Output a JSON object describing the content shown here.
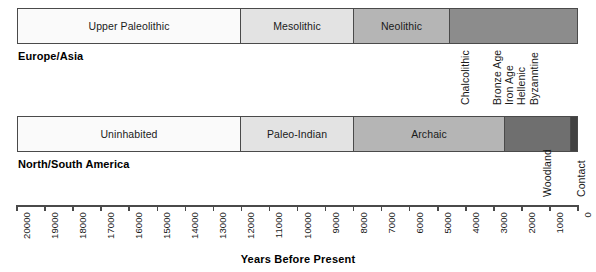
{
  "chart_data": {
    "type": "bar",
    "title": "",
    "xlabel": "Years Before Present",
    "ylabel": "",
    "xlim": [
      20000,
      0
    ],
    "x_tick_step": 1000,
    "x_direction": "reversed",
    "grid": false,
    "legend": false,
    "axis_ticks": [
      "20000",
      "19000",
      "18000",
      "17000",
      "16000",
      "15000",
      "14000",
      "13000",
      "12000",
      "11000",
      "10000",
      "9000",
      "8000",
      "7000",
      "6000",
      "5000",
      "4000",
      "3000",
      "2000",
      "1000",
      "0"
    ],
    "series": [
      {
        "name": "Europe/Asia",
        "segments": [
          {
            "label": "Upper Paleolithic",
            "start": 20000,
            "end": 12000,
            "color": "#fafafa",
            "label_placement": "inside"
          },
          {
            "label": "Mesolithic",
            "start": 12000,
            "end": 8000,
            "color": "#e3e3e3",
            "label_placement": "inside"
          },
          {
            "label": "Neolithic",
            "start": 8000,
            "end": 4600,
            "color": "#b5b5b5",
            "label_placement": "inside"
          },
          {
            "label": "Chalcolithic",
            "start": 4600,
            "end": 0,
            "color": "#8c8c8c",
            "label_placement": "below-vertical"
          },
          {
            "label": "Bronze Age",
            "start": 0,
            "end": 0,
            "color": "#8c8c8c",
            "label_placement": "below-vertical"
          },
          {
            "label": "Iron Age",
            "start": 0,
            "end": 0,
            "color": "#8c8c8c",
            "label_placement": "below-vertical"
          },
          {
            "label": "Hellenic",
            "start": 0,
            "end": 0,
            "color": "#8c8c8c",
            "label_placement": "below-vertical"
          },
          {
            "label": "Byzanntine",
            "start": 0,
            "end": 0,
            "color": "#8c8c8c",
            "label_placement": "below-vertical"
          }
        ]
      },
      {
        "name": "North/South America",
        "segments": [
          {
            "label": "Uninhabited",
            "start": 20000,
            "end": 12000,
            "color": "#fafafa",
            "label_placement": "inside"
          },
          {
            "label": "Paleo-Indian",
            "start": 12000,
            "end": 8000,
            "color": "#e3e3e3",
            "label_placement": "inside"
          },
          {
            "label": "Archaic",
            "start": 8000,
            "end": 2600,
            "color": "#b5b5b5",
            "label_placement": "inside"
          },
          {
            "label": "Woodland",
            "start": 2600,
            "end": 300,
            "color": "#6f6f6f",
            "label_placement": "below-vertical"
          },
          {
            "label": "Contact",
            "start": 300,
            "end": 0,
            "color": "#414141",
            "label_placement": "below-vertical"
          }
        ]
      }
    ]
  },
  "rows": [
    {
      "region_label": "Europe/Asia",
      "inside_segments": [
        {
          "name": "Upper Paleolithic",
          "left": 0,
          "width": 223,
          "color": "#fafafa"
        },
        {
          "name": "Mesolithic",
          "left": 223,
          "width": 113,
          "color": "#e3e3e3"
        },
        {
          "name": "Neolithic",
          "left": 336,
          "width": 96,
          "color": "#b5b5b5"
        },
        {
          "name": "",
          "left": 432,
          "width": 129,
          "color": "#8c8c8c"
        }
      ],
      "vertical_labels": [
        {
          "text": "Chalcolithic",
          "x": 459,
          "y": 105
        },
        {
          "text": "Bronze Age",
          "x": 491,
          "y": 105
        },
        {
          "text": "Iron Age",
          "x": 503,
          "y": 105
        },
        {
          "text": "Hellenic",
          "x": 515,
          "y": 105
        },
        {
          "text": "Byzanntine",
          "x": 528,
          "y": 105
        }
      ]
    },
    {
      "region_label": "North/South America",
      "inside_segments": [
        {
          "name": "Uninhabited",
          "left": 0,
          "width": 223,
          "color": "#fafafa"
        },
        {
          "name": "Paleo-Indian",
          "left": 223,
          "width": 113,
          "color": "#e3e3e3"
        },
        {
          "name": "Archaic",
          "left": 336,
          "width": 151,
          "color": "#b5b5b5"
        },
        {
          "name": "",
          "left": 487,
          "width": 66,
          "color": "#6f6f6f"
        },
        {
          "name": "",
          "left": 553,
          "width": 8,
          "color": "#414141"
        }
      ],
      "vertical_labels": [
        {
          "text": "Woodland",
          "x": 541,
          "y": 197
        },
        {
          "text": "Contact",
          "x": 575,
          "y": 197
        }
      ]
    }
  ],
  "axis": {
    "title": "Years Before Present",
    "ticks": [
      "20000",
      "19000",
      "18000",
      "17000",
      "16000",
      "15000",
      "14000",
      "13000",
      "12000",
      "11000",
      "10000",
      "9000",
      "8000",
      "7000",
      "6000",
      "5000",
      "4000",
      "3000",
      "2000",
      "1000",
      "0"
    ],
    "left_px": 17,
    "width_px": 561
  },
  "colors": {
    "lightest": "#fafafa",
    "light": "#e3e3e3",
    "medium": "#b5b5b5",
    "dark": "#8c8c8c",
    "darker": "#6f6f6f",
    "darkest": "#414141",
    "outline": "#4a4a4a",
    "text": "#1a1a1a"
  }
}
